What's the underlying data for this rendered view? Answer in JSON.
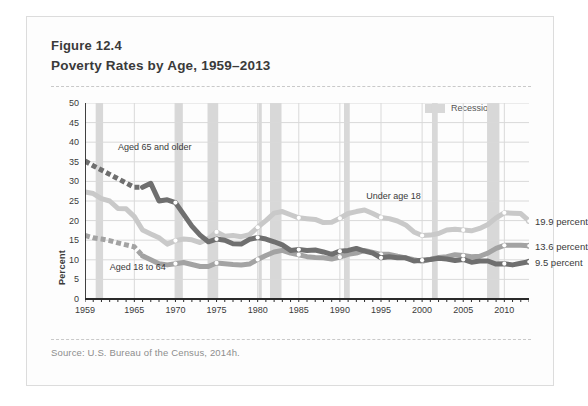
{
  "figure": {
    "number": "Figure 12.4",
    "title": "Poverty Rates by Age, 1959–2013",
    "source": "Source: U.S. Bureau of the Census, 2014h."
  },
  "legend": {
    "recession_label": "Recession",
    "recession_color": "#d8d8d8"
  },
  "colors": {
    "under18": "#c9c9c9",
    "aged18to64": "#a3a3a3",
    "aged65plus": "#6f6f6f",
    "grid": "#d9d9d9",
    "axis": "#2b2b2b",
    "text": "#3a3a3a"
  },
  "annotations": {
    "aged65plus": "Aged 65 and older",
    "aged18to64": "Aged 18 to 64",
    "under18": "Under age 18"
  },
  "end_labels": {
    "under18": "19.9 percent",
    "aged18to64": "13.6 percent",
    "aged65plus": "9.5 percent"
  },
  "chart_data": {
    "type": "line",
    "title": "Poverty Rates by Age, 1959–2013",
    "xlabel": "",
    "ylabel": "Percent",
    "xlim": [
      1959,
      2013
    ],
    "ylim": [
      0,
      50
    ],
    "ytick_values": [
      0,
      5,
      10,
      15,
      20,
      25,
      30,
      35,
      40,
      45,
      50
    ],
    "xtick_values": [
      1959,
      1965,
      1970,
      1975,
      1980,
      1985,
      1990,
      1995,
      2000,
      2005,
      2010
    ],
    "grid": true,
    "legend_position": "top-right",
    "x": [
      1959,
      1960,
      1961,
      1962,
      1963,
      1964,
      1965,
      1966,
      1967,
      1968,
      1969,
      1970,
      1971,
      1972,
      1973,
      1974,
      1975,
      1976,
      1977,
      1978,
      1979,
      1980,
      1981,
      1982,
      1983,
      1984,
      1985,
      1986,
      1987,
      1988,
      1989,
      1990,
      1991,
      1992,
      1993,
      1994,
      1995,
      1996,
      1997,
      1998,
      1999,
      2000,
      2001,
      2002,
      2003,
      2004,
      2005,
      2006,
      2007,
      2008,
      2009,
      2010,
      2011,
      2012,
      2013
    ],
    "series": [
      {
        "name": "Under age 18",
        "color": "#c9c9c9",
        "dashed_range": [],
        "values": [
          27.3,
          26.9,
          25.6,
          25.0,
          23.1,
          23.0,
          21.0,
          17.6,
          16.6,
          15.6,
          14.0,
          14.9,
          15.3,
          15.1,
          14.4,
          15.4,
          17.1,
          16.0,
          16.2,
          15.9,
          16.4,
          18.3,
          20.0,
          21.9,
          22.3,
          21.5,
          20.7,
          20.5,
          20.3,
          19.5,
          19.6,
          20.6,
          21.8,
          22.3,
          22.7,
          21.8,
          20.8,
          20.5,
          19.9,
          18.9,
          17.1,
          16.2,
          16.3,
          16.7,
          17.6,
          17.8,
          17.6,
          17.4,
          18.0,
          19.0,
          20.7,
          22.0,
          21.9,
          21.8,
          19.9
        ]
      },
      {
        "name": "Aged 18 to 64",
        "color": "#a3a3a3",
        "dashed_range": [
          1959,
          1966
        ],
        "values": [
          16.2,
          15.6,
          15.3,
          14.9,
          14.3,
          13.8,
          13.3,
          11.0,
          10.0,
          9.0,
          8.7,
          9.0,
          9.3,
          8.8,
          8.3,
          8.3,
          9.2,
          9.0,
          8.8,
          8.7,
          8.9,
          10.1,
          11.1,
          12.0,
          12.4,
          11.7,
          11.3,
          10.8,
          10.6,
          10.5,
          10.2,
          10.7,
          11.4,
          11.7,
          12.4,
          11.9,
          11.4,
          11.4,
          10.9,
          10.5,
          10.0,
          9.6,
          10.1,
          10.6,
          10.8,
          11.3,
          11.1,
          10.8,
          10.9,
          11.7,
          12.9,
          13.7,
          13.7,
          13.7,
          13.6
        ]
      },
      {
        "name": "Aged 65 and older",
        "color": "#6f6f6f",
        "dashed_range": [
          1959,
          1966
        ],
        "values": [
          35.2,
          34.0,
          32.9,
          31.8,
          30.7,
          29.6,
          28.5,
          28.5,
          29.5,
          25.0,
          25.3,
          24.6,
          21.6,
          18.6,
          16.3,
          14.6,
          15.3,
          15.0,
          14.1,
          14.0,
          15.2,
          15.7,
          15.3,
          14.6,
          13.8,
          12.4,
          12.6,
          12.4,
          12.5,
          12.0,
          11.4,
          12.2,
          12.4,
          12.9,
          12.2,
          11.7,
          10.5,
          10.8,
          10.5,
          10.5,
          9.7,
          9.9,
          10.1,
          10.4,
          10.2,
          9.8,
          10.1,
          9.4,
          9.7,
          9.7,
          8.9,
          9.0,
          8.7,
          9.1,
          9.5
        ]
      }
    ],
    "recessions": [
      {
        "start": 1960.3,
        "end": 1961.2
      },
      {
        "start": 1969.9,
        "end": 1970.9
      },
      {
        "start": 1973.9,
        "end": 1975.2
      },
      {
        "start": 1980.1,
        "end": 1980.5
      },
      {
        "start": 1981.5,
        "end": 1982.9
      },
      {
        "start": 1990.5,
        "end": 1991.2
      },
      {
        "start": 2001.2,
        "end": 2001.9
      },
      {
        "start": 2007.9,
        "end": 2009.4
      }
    ]
  }
}
